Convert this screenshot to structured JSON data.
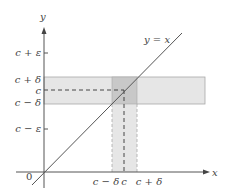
{
  "diagram": {
    "type": "epsilon-delta illustration",
    "axes": {
      "x_label": "x",
      "y_label": "y",
      "origin_label": "0"
    },
    "line": {
      "label": "y = x",
      "color": "#555555"
    },
    "y_ticks": {
      "c_plus_epsilon": "c + ε",
      "c_plus_delta": "c + δ",
      "c": "c",
      "c_minus_delta": "c − δ",
      "c_minus_epsilon": "c − ε"
    },
    "x_ticks": {
      "c_minus_delta": "c − δ",
      "c": "c",
      "c_plus_delta": "c + δ"
    },
    "colors": {
      "band_light": "#e6e6e6",
      "band_overlap": "#c8c8c8",
      "axis": "#555555",
      "band_edge": "#a8a8a8"
    }
  }
}
